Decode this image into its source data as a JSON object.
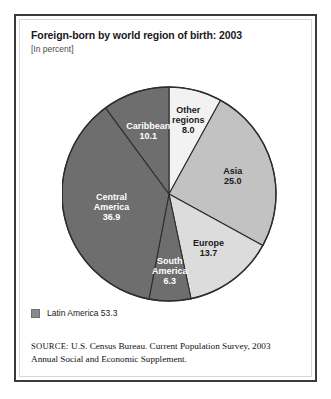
{
  "figure": {
    "title": "Foreign-born by world region of birth: 2003",
    "subtitle": "[In percent]"
  },
  "legend": {
    "swatch_color": "#8a8a8a",
    "label": "Latin America 53.3"
  },
  "source": {
    "label": "SOURCE:",
    "text": " U.S. Census Bureau. Current Population Survey, 2003 Annual Social and Economic Supplement."
  },
  "chart_data": {
    "type": "pie",
    "title": "Foreign-born by world region of birth: 2003",
    "subtitle": "[In percent]",
    "unit": "percent",
    "start_angle_deg": 0,
    "direction": "clockwise",
    "legend_position": "below",
    "grid": false,
    "categories": [
      "Other regions",
      "Asia",
      "Europe",
      "South America",
      "Central America",
      "Caribbean"
    ],
    "values": [
      8.0,
      25.0,
      13.7,
      6.3,
      36.9,
      10.1
    ],
    "slices": [
      {
        "name": "Other regions",
        "value": 8.0,
        "label_line1": "Other",
        "label_line2": "regions",
        "label_value": "8.0",
        "color": "#f2f2f2",
        "text_color": "dark"
      },
      {
        "name": "Asia",
        "value": 25.0,
        "label_line1": "Asia",
        "label_line2": "",
        "label_value": "25.0",
        "color": "#c2c2c2",
        "text_color": "dark"
      },
      {
        "name": "Europe",
        "value": 13.7,
        "label_line1": "Europe",
        "label_line2": "",
        "label_value": "13.7",
        "color": "#dcdcdc",
        "text_color": "dark"
      },
      {
        "name": "South America",
        "value": 6.3,
        "label_line1": "South",
        "label_line2": "America",
        "label_value": "6.3",
        "color": "#6e6e6e",
        "text_color": "light"
      },
      {
        "name": "Central America",
        "value": 36.9,
        "label_line1": "Central",
        "label_line2": "America",
        "label_value": "36.9",
        "color": "#6e6e6e",
        "text_color": "light"
      },
      {
        "name": "Caribbean",
        "value": 10.1,
        "label_line1": "Caribbean",
        "label_line2": "",
        "label_value": "10.1",
        "color": "#6e6e6e",
        "text_color": "light"
      }
    ],
    "groups": [
      {
        "name": "Latin America",
        "value": 53.3,
        "members": [
          "South America",
          "Central America",
          "Caribbean"
        ]
      }
    ]
  }
}
